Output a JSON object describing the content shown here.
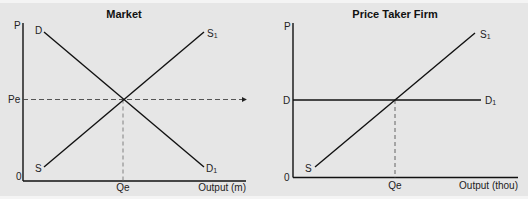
{
  "colors": {
    "background": "#e6e6e6",
    "outer": "#f4f4f4",
    "line": "#111111",
    "dashed": "#555555",
    "text": "#222222"
  },
  "panels": [
    {
      "title": "Market",
      "y_axis_label": "P",
      "origin_label": "0",
      "x_axis_label": "Output (m)",
      "price_label": "Pe",
      "quantity_label": "Qe",
      "demand_start_label": "D",
      "demand_end_label": "D",
      "demand_end_sub": "1",
      "supply_start_label": "S",
      "supply_end_label": "S",
      "supply_end_sub": "1"
    },
    {
      "title": "Price Taker Firm",
      "y_axis_label": "P",
      "origin_label": "0",
      "x_axis_label": "Output (thou)",
      "price_label": "D",
      "quantity_label": "Qe",
      "demand_end_label": "D",
      "demand_end_sub": "1",
      "supply_start_label": "S",
      "supply_end_label": "S",
      "supply_end_sub": "1"
    }
  ]
}
